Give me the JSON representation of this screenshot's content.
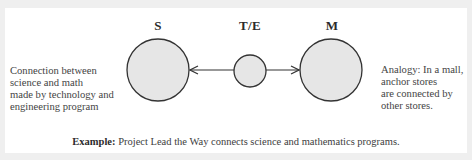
{
  "diagram": {
    "nodes": [
      {
        "id": "S",
        "label": "S",
        "size": "large"
      },
      {
        "id": "TE",
        "label": "T/E",
        "size": "small"
      },
      {
        "id": "M",
        "label": "M",
        "size": "large"
      }
    ],
    "edges": [
      {
        "from": "TE",
        "to": "S",
        "type": "arrow"
      },
      {
        "from": "TE",
        "to": "M",
        "type": "arrow"
      }
    ],
    "left_text": {
      "lines": [
        "Connection between",
        "science and math",
        "made by technology and",
        "engineering program"
      ]
    },
    "right_text": {
      "lines": [
        "Analogy: In a mall,",
        "anchor stores",
        "are connected by",
        "other stores."
      ]
    },
    "caption": {
      "label": "Example:",
      "text": " Project Lead the Way connects science and mathematics programs."
    },
    "colors": {
      "node_fill": "#e6e6e6",
      "node_stroke": "#333333",
      "arrow": "#333333",
      "background": "#efefef",
      "panel": "#ffffff"
    }
  }
}
